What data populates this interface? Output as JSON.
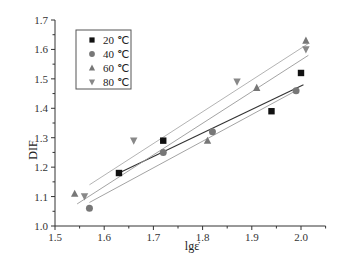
{
  "chart_data": {
    "type": "scatter",
    "title": "",
    "xlabel": "lgε̇",
    "ylabel": "DIF",
    "xlim": [
      1.5,
      2.05
    ],
    "ylim": [
      1.0,
      1.7
    ],
    "xticks": [
      "1.5",
      "1.6",
      "1.7",
      "1.8",
      "1.9",
      "2.0"
    ],
    "yticks": [
      "1.0",
      "1.1",
      "1.2",
      "1.3",
      "1.4",
      "1.5",
      "1.6",
      "1.7"
    ],
    "grid": false,
    "legend_position": "upper-left",
    "series": [
      {
        "name": "20 ℃",
        "marker": "square",
        "color": "#111111",
        "points": [
          [
            1.63,
            1.18
          ],
          [
            1.72,
            1.29
          ],
          [
            1.94,
            1.39
          ],
          [
            2.0,
            1.52
          ]
        ],
        "fit_line": [
          [
            1.63,
            1.18
          ],
          [
            2.005,
            1.48
          ]
        ],
        "fit_color": "#333333"
      },
      {
        "name": "40 ℃",
        "marker": "circle",
        "color": "#777777",
        "points": [
          [
            1.57,
            1.06
          ],
          [
            1.72,
            1.25
          ],
          [
            1.82,
            1.32
          ],
          [
            1.99,
            1.46
          ]
        ],
        "fit_line": [
          [
            1.57,
            1.08
          ],
          [
            1.99,
            1.46
          ]
        ],
        "fit_color": "#999999"
      },
      {
        "name": "60 ℃",
        "marker": "triangle-up",
        "color": "#777777",
        "points": [
          [
            1.54,
            1.11
          ],
          [
            1.81,
            1.29
          ],
          [
            1.91,
            1.47
          ],
          [
            2.01,
            1.63
          ]
        ],
        "fit_line": [
          [
            1.545,
            1.075
          ],
          [
            2.015,
            1.58
          ]
        ],
        "fit_color": "#999999"
      },
      {
        "name": "80 ℃",
        "marker": "triangle-down",
        "color": "#888888",
        "points": [
          [
            1.56,
            1.1
          ],
          [
            1.66,
            1.29
          ],
          [
            1.87,
            1.49
          ],
          [
            2.01,
            1.6
          ]
        ],
        "fit_line": [
          [
            1.57,
            1.14
          ],
          [
            2.015,
            1.62
          ]
        ],
        "fit_color": "#aaaaaa"
      }
    ]
  }
}
